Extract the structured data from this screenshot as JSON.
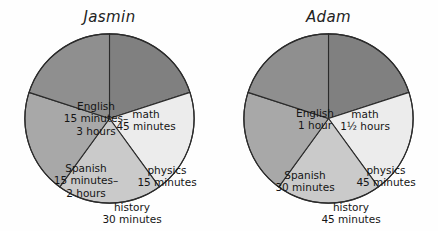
{
  "chart_data": [
    {
      "type": "pie",
      "title": "Jasmin",
      "legend_position": "in-slice",
      "grid": false,
      "categories": [
        "math",
        "physics",
        "history",
        "Spanish",
        "English"
      ],
      "values": [
        20,
        20,
        20,
        20,
        20
      ],
      "slices": [
        {
          "name": "math",
          "label_lines": [
            "math",
            "45 minutes"
          ],
          "duration_text": "45 minutes",
          "angle_deg": 72,
          "start_deg": 0,
          "color": "#808080",
          "label_x": 122,
          "label_y": 87
        },
        {
          "name": "physics",
          "label_lines": [
            "physics",
            "15 minutes"
          ],
          "duration_text": "15 minutes",
          "angle_deg": 72,
          "start_deg": 72,
          "color": "#ececec",
          "label_x": 143,
          "label_y": 143
        },
        {
          "name": "history",
          "label_lines": [
            "history",
            "30 minutes"
          ],
          "duration_text": "30 minutes",
          "angle_deg": 72,
          "start_deg": 144,
          "color": "#cacaca",
          "label_x": 108,
          "label_y": 180
        },
        {
          "name": "Spanish",
          "label_lines": [
            "Spanish",
            "15 minutes–",
            "2 hours"
          ],
          "duration_text": "15 minutes–2 hours",
          "angle_deg": 72,
          "start_deg": 216,
          "color": "#a8a8a8",
          "label_x": 62,
          "label_y": 148
        },
        {
          "name": "English",
          "label_lines": [
            "English",
            "15 minutes–",
            "3 hours"
          ],
          "duration_text": "15 minutes–3 hours",
          "angle_deg": 72,
          "start_deg": 288,
          "color": "#8f8f8f",
          "label_x": 72,
          "label_y": 86
        }
      ]
    },
    {
      "type": "pie",
      "title": "Adam",
      "legend_position": "in-slice",
      "grid": false,
      "categories": [
        "math",
        "physics",
        "history",
        "Spanish",
        "English"
      ],
      "values": [
        20,
        20,
        20,
        20,
        20
      ],
      "slices": [
        {
          "name": "math",
          "label_lines": [
            "math",
            "1½ hours"
          ],
          "duration_text": "1½ hours",
          "angle_deg": 72,
          "start_deg": 0,
          "color": "#808080",
          "label_x": 122,
          "label_y": 87
        },
        {
          "name": "physics",
          "label_lines": [
            "physics",
            "45 minutes"
          ],
          "duration_text": "45 minutes",
          "angle_deg": 72,
          "start_deg": 72,
          "color": "#ececec",
          "label_x": 143,
          "label_y": 143
        },
        {
          "name": "history",
          "label_lines": [
            "history",
            "45 minutes"
          ],
          "duration_text": "45 minutes",
          "angle_deg": 72,
          "start_deg": 144,
          "color": "#cacaca",
          "label_x": 108,
          "label_y": 180
        },
        {
          "name": "Spanish",
          "label_lines": [
            "Spanish",
            "30 minutes"
          ],
          "duration_text": "30 minutes",
          "angle_deg": 72,
          "start_deg": 216,
          "color": "#a8a8a8",
          "label_x": 62,
          "label_y": 148
        },
        {
          "name": "English",
          "label_lines": [
            "English",
            "1 hour"
          ],
          "duration_text": "1 hour",
          "angle_deg": 72,
          "start_deg": 288,
          "color": "#8f8f8f",
          "label_x": 72,
          "label_y": 86
        }
      ]
    }
  ]
}
